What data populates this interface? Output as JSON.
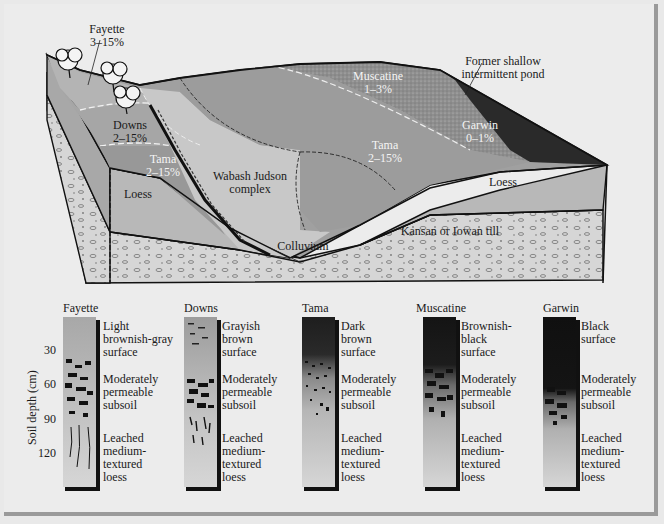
{
  "diagram": {
    "type": "soil catena block diagram with soil profile columns",
    "block_labels": {
      "fayette": {
        "name": "Fayette",
        "slope": "3–15%"
      },
      "downs": {
        "name": "Downs",
        "slope": "2–15%"
      },
      "tama_left": {
        "name": "Tama",
        "slope": "2–15%"
      },
      "tama_right": {
        "name": "Tama",
        "slope": "2–15%"
      },
      "muscatine": {
        "name": "Muscatine",
        "slope": "1–3%"
      },
      "garwin": {
        "name": "Garwin",
        "slope": "0–1%"
      },
      "wabash": {
        "line1": "Wabash Judson",
        "line2": "complex"
      },
      "pond": {
        "line1": "Former shallow",
        "line2": "intermittent pond"
      },
      "loess_left": "Loess",
      "loess_right": "Loess",
      "colluvium": "Colluvium",
      "till": "Kansan or Iowan till"
    },
    "profiles": {
      "y_axis_label": "Soil depth (cm)",
      "y_ticks": [
        "30",
        "60",
        "90",
        "120"
      ],
      "columns": [
        {
          "name": "Fayette",
          "surface": "Light\nbrownish-gray\nsurface",
          "subsoil": "Moderately\npermeable\nsubsoil",
          "base": "Leached\nmedium-\ntextured\nloess"
        },
        {
          "name": "Downs",
          "surface": "Grayish\nbrown\nsurface",
          "subsoil": "Moderately\npermeable\nsubsoil",
          "base": "Leached\nmedium-\ntextured\nloess"
        },
        {
          "name": "Tama",
          "surface": "Dark\nbrown\nsurface",
          "subsoil": "Moderately\npermeable\nsubsoil",
          "base": "Leached\nmedium-\ntextured\nloess"
        },
        {
          "name": "Muscatine",
          "surface": "Brownish-\nblack\nsurface",
          "subsoil": "Moderately\npermeable\nsubsoil",
          "base": "Leached\nmedium-\ntextured\nloess"
        },
        {
          "name": "Garwin",
          "surface": "Black\nsurface",
          "subsoil": "Moderately\npermeable\nsubsoil",
          "base": "Leached\nmedium-\ntextured\nloess"
        }
      ]
    },
    "colors": {
      "background": "#ececec",
      "fayette_surface": "#b4b4b4",
      "downs_surface": "#a6a6a6",
      "tama_surface": "#9c9c9c",
      "wabash": "#c8c8c8",
      "muscatine": "#8e8e8e",
      "garwin": "#2a2a2a",
      "loess": "#b8b8b8",
      "till": "#d6d6d6",
      "outline": "#111111"
    }
  }
}
